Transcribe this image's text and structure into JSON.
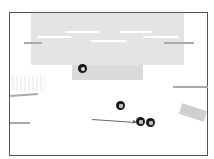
{
  "scene": {
    "colors": {
      "frame": "#555555",
      "top_area": "#e4e4e4",
      "sub_area": "#dadada",
      "token": "#1a1a1a",
      "ledge": "#aaaaaa",
      "arrow": "#666666"
    },
    "tokens": [
      {
        "id": "token-a",
        "x": 78,
        "y": 64,
        "icon": "circle-arrow-icon"
      },
      {
        "id": "token-b",
        "x": 116,
        "y": 101,
        "icon": "square-icon"
      },
      {
        "id": "token-c",
        "x": 136,
        "y": 117,
        "icon": "square-icon"
      },
      {
        "id": "token-d",
        "x": 146,
        "y": 118,
        "icon": "square-icon"
      }
    ]
  }
}
